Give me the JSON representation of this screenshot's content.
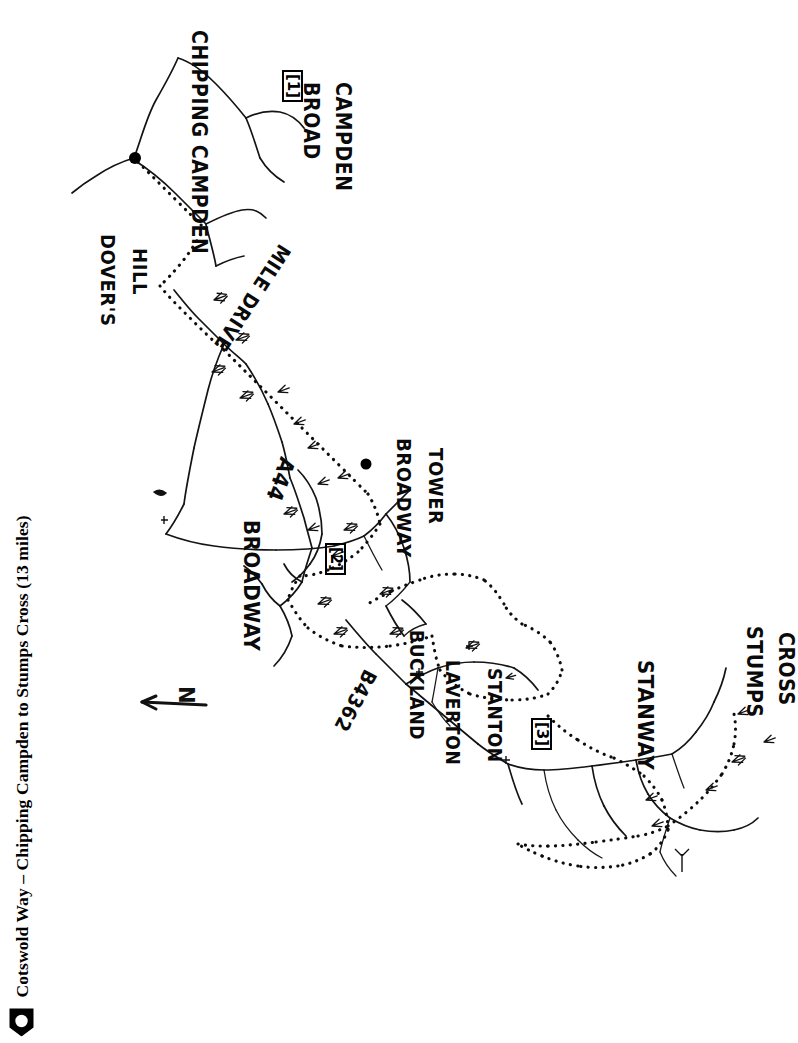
{
  "title": {
    "text": "Cotswold Way – Chipping Campden to Stumps Cross (13 miles)",
    "marker_icon": "left-arrow-bullet-icon",
    "orientation": "rotated-90-ccw"
  },
  "map": {
    "orientation_note": "hand-drawn sketch map, rotated 90° (north points left)",
    "north_indicator": {
      "label": "N",
      "icon": "north-arrow-icon"
    },
    "background_color": "#ffffff",
    "ink_color": "#111111",
    "trail_style": "dotted",
    "road_style": "solid",
    "places": [
      {
        "id": "chipping-campden",
        "name": "CHIPPING CAMPDEN",
        "x": 163,
        "y": 30,
        "rot": 90,
        "size": 21,
        "has_dot": true
      },
      {
        "id": "broad-campden",
        "name": "BROAD",
        "x": 275,
        "y": 82,
        "rot": 90,
        "size": 21,
        "has_dot": false
      },
      {
        "id": "broad-campden-2",
        "name": "CAMPDEN",
        "x": 307,
        "y": 82,
        "rot": 90,
        "size": 21,
        "has_dot": false
      },
      {
        "id": "dovers-hill",
        "name": "DOVER'S",
        "x": 72,
        "y": 234,
        "rot": 90,
        "size": 20,
        "has_dot": false
      },
      {
        "id": "dovers-hill-2",
        "name": "HILL",
        "x": 104,
        "y": 248,
        "rot": 90,
        "size": 20,
        "has_dot": false
      },
      {
        "id": "mile-drive",
        "name": "MILE DRIVE",
        "x": 248,
        "y": 256,
        "rot": 110,
        "size": 20,
        "has_dot": false
      },
      {
        "id": "a44",
        "name": "A44",
        "x": 258,
        "y": 468,
        "rot": 105,
        "size": 21,
        "has_dot": false
      },
      {
        "id": "broadway",
        "name": "BROADWAY",
        "x": 222,
        "y": 524,
        "rot": 90,
        "size": 21,
        "has_dot": false
      },
      {
        "id": "broadway-tower",
        "name": "BROADWAY",
        "x": 370,
        "y": 440,
        "rot": 90,
        "size": 20,
        "has_dot": true
      },
      {
        "id": "broadway-tower-2",
        "name": "TOWER",
        "x": 400,
        "y": 450,
        "rot": 90,
        "size": 20,
        "has_dot": false
      },
      {
        "id": "b4362",
        "name": "B4362",
        "x": 364,
        "y": 694,
        "rot": 108,
        "size": 20,
        "has_dot": false
      },
      {
        "id": "buckland",
        "name": "BUCKLAND",
        "x": 382,
        "y": 632,
        "rot": 90,
        "size": 19,
        "has_dot": false
      },
      {
        "id": "laverton",
        "name": "LAVERTON",
        "x": 418,
        "y": 662,
        "rot": 90,
        "size": 19,
        "has_dot": false
      },
      {
        "id": "stanton",
        "name": "STANTON",
        "x": 462,
        "y": 672,
        "rot": 90,
        "size": 19,
        "has_dot": false
      },
      {
        "id": "stanway",
        "name": "STANWAY",
        "x": 612,
        "y": 662,
        "rot": 90,
        "size": 21,
        "has_dot": false
      },
      {
        "id": "stumps-cross",
        "name": "STUMPS",
        "x": 722,
        "y": 628,
        "rot": 90,
        "size": 21,
        "has_dot": false
      },
      {
        "id": "stumps-cross-2",
        "name": "CROSS",
        "x": 752,
        "y": 634,
        "rot": 90,
        "size": 21,
        "has_dot": false
      }
    ],
    "waypoints": [
      {
        "id": "waypoint-1",
        "label": "[1]",
        "x": 257,
        "y": 70,
        "rot": 90
      },
      {
        "id": "waypoint-2",
        "label": "[2]",
        "x": 300,
        "y": 543,
        "rot": 90
      },
      {
        "id": "waypoint-3",
        "label": "[3]",
        "x": 506,
        "y": 718,
        "rot": 90
      }
    ]
  }
}
